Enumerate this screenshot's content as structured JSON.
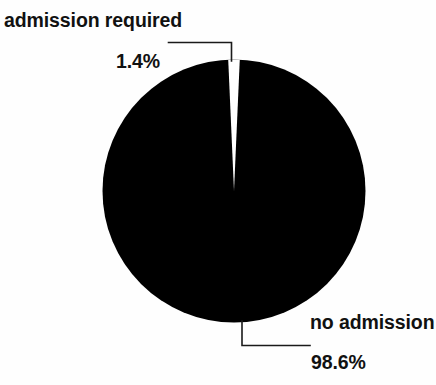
{
  "chart_data": {
    "type": "pie",
    "title": "",
    "categories": [
      "admission required",
      "no admission"
    ],
    "values": [
      1.4,
      98.6
    ],
    "value_labels": [
      "1.4%",
      "98.6%"
    ],
    "unit": "percent",
    "legend": "none",
    "grid": false,
    "slice_colors": [
      "#ffffff",
      "#000000"
    ],
    "start_angle_deg": 0,
    "direction": "clockwise",
    "slices": [
      {
        "label": "admission required",
        "value": 1.4,
        "value_label": "1.4%",
        "color": "#ffffff",
        "label_position": "top-left",
        "leader": "elbow"
      },
      {
        "label": "no admission",
        "value": 98.6,
        "value_label": "98.6%",
        "color": "#000000",
        "label_position": "bottom-right",
        "leader": "elbow"
      }
    ]
  },
  "labels": {
    "required_name": "admission required",
    "required_pct": "1.4%",
    "noadmission_name": "no admission",
    "noadmission_pct": "98.6%"
  },
  "colors": {
    "background": "#fefefe",
    "ink": "#000000",
    "slice_major": "#000000",
    "slice_minor": "#ffffff",
    "leader_line": "#1a1a1a"
  }
}
